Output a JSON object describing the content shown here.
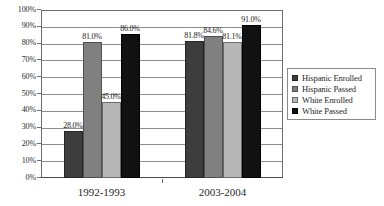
{
  "chart_data": {
    "type": "bar",
    "title": "",
    "xlabel": "",
    "ylabel": "",
    "categories": [
      "1992-1993",
      "2003-2004"
    ],
    "series": [
      {
        "name": "Hispanic Enrolled",
        "values": [
          28.0,
          81.8
        ],
        "labels": [
          "28.0%",
          "81.8%"
        ],
        "color": "#3d3d3d"
      },
      {
        "name": "Hispanic Passed",
        "values": [
          81.0,
          84.6
        ],
        "labels": [
          "81.0%",
          "84.6%"
        ],
        "color": "#808080"
      },
      {
        "name": "White Enrolled",
        "values": [
          45.0,
          81.1
        ],
        "labels": [
          "45.0%",
          "81.1%"
        ],
        "color": "#b7b7b7"
      },
      {
        "name": "White Passed",
        "values": [
          86.0,
          91.0
        ],
        "labels": [
          "86.0%",
          "91.0%"
        ],
        "color": "#111111"
      }
    ],
    "ylim": [
      0,
      100
    ],
    "ytick_labels": [
      "0%",
      "10%",
      "20%",
      "30%",
      "40%",
      "50%",
      "60%",
      "70%",
      "80%",
      "90%",
      "100%"
    ],
    "ytick_values": [
      0,
      10,
      20,
      30,
      40,
      50,
      60,
      70,
      80,
      90,
      100
    ],
    "grid": true,
    "grid_axis": "y",
    "legend_position": "right",
    "value_labels_shown": true
  }
}
